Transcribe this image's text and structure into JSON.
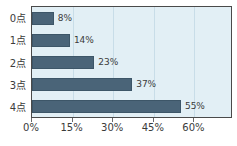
{
  "chart_data": {
    "type": "bar",
    "orientation": "horizontal",
    "title": "",
    "subtitle": "",
    "xlabel": "",
    "ylabel": "",
    "categories": [
      "0点",
      "1点",
      "2点",
      "3点",
      "4点"
    ],
    "values": [
      8,
      14,
      23,
      37,
      55
    ],
    "value_labels": [
      "8%",
      "14%",
      "23%",
      "37%",
      "55%"
    ],
    "xlim": [
      0,
      73.5
    ],
    "x_ticks": [
      0,
      15,
      30,
      45,
      60
    ],
    "x_tick_labels": [
      "0%",
      "15%",
      "30%",
      "45%",
      "60%"
    ],
    "grid": true,
    "grid_axis": "x",
    "legend": false,
    "legend_position": "none",
    "series": [
      {
        "name": "",
        "values": [
          8,
          14,
          23,
          37,
          55
        ]
      }
    ],
    "colors": {
      "bar_fill": "#4a6478",
      "bar_edge": "#3d5668",
      "plot_background": "#e2eff5",
      "frame_border": "#4a4a4a",
      "gridline": "#c8dde8",
      "text": "#3b3b3b",
      "figure_background": "#ffffff"
    }
  }
}
